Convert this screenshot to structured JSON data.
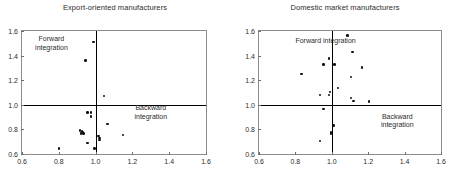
{
  "chart_data": [
    {
      "type": "scatter",
      "title": "Export-oriented manufacturers",
      "xlabel": "",
      "ylabel": "",
      "xlim": [
        0.6,
        1.6
      ],
      "ylim": [
        0.6,
        1.6
      ],
      "xticks": [
        "0.6",
        "0.8",
        "1.0",
        "1.2",
        "1.4",
        "1.6"
      ],
      "xtick_values": [
        0.6,
        0.8,
        1.0,
        1.2,
        1.4,
        1.6
      ],
      "yticks": [
        "0.6",
        "0.8",
        "1.0",
        "1.2",
        "1.4",
        "1.6"
      ],
      "ytick_values": [
        0.6,
        0.8,
        1.0,
        1.2,
        1.4,
        1.6
      ],
      "grid": false,
      "legend": "none",
      "reference_lines": {
        "x": 1.0,
        "y": 1.0
      },
      "annotations": [
        {
          "text": "Forward\nintegration",
          "x": 0.76,
          "y": 1.5,
          "align": "center"
        },
        {
          "text": "Backward integration",
          "x": 1.3,
          "y": 0.94,
          "align": "center"
        }
      ],
      "points": [
        {
          "x": 0.99,
          "y": 1.51
        },
        {
          "x": 0.945,
          "y": 1.36
        },
        {
          "x": 1.045,
          "y": 1.07
        },
        {
          "x": 0.955,
          "y": 0.935
        },
        {
          "x": 0.975,
          "y": 0.935
        },
        {
          "x": 0.975,
          "y": 0.905
        },
        {
          "x": 1.065,
          "y": 0.845
        },
        {
          "x": 0.915,
          "y": 0.79
        },
        {
          "x": 0.925,
          "y": 0.785
        },
        {
          "x": 0.93,
          "y": 0.775
        },
        {
          "x": 0.92,
          "y": 0.765
        },
        {
          "x": 0.935,
          "y": 0.765
        },
        {
          "x": 1.15,
          "y": 0.755
        },
        {
          "x": 1.015,
          "y": 0.745
        },
        {
          "x": 1.02,
          "y": 0.73
        },
        {
          "x": 1.02,
          "y": 0.715
        },
        {
          "x": 0.955,
          "y": 0.69
        },
        {
          "x": 0.8,
          "y": 0.645
        },
        {
          "x": 0.995,
          "y": 0.645
        }
      ]
    },
    {
      "type": "scatter",
      "title": "Domestic market manufacturers",
      "xlabel": "",
      "ylabel": "",
      "xlim": [
        0.6,
        1.6
      ],
      "ylim": [
        0.6,
        1.6
      ],
      "xticks": [
        "0.6",
        "0.8",
        "1.0",
        "1.2",
        "1.4",
        "1.6"
      ],
      "xtick_values": [
        0.6,
        0.8,
        1.0,
        1.2,
        1.4,
        1.6
      ],
      "yticks": [
        "0.6",
        "0.8",
        "1.0",
        "1.2",
        "1.4",
        "1.6"
      ],
      "ytick_values": [
        0.6,
        0.8,
        1.0,
        1.2,
        1.4,
        1.6
      ],
      "grid": false,
      "legend": "none",
      "reference_lines": {
        "x": 1.0,
        "y": 1.0
      },
      "annotations": [
        {
          "text": "Forward integration",
          "x": 0.8,
          "y": 1.52,
          "align": "left"
        },
        {
          "text": "Backward\nintegration",
          "x": 1.36,
          "y": 0.87,
          "align": "center"
        }
      ],
      "points": [
        {
          "x": 1.085,
          "y": 1.565
        },
        {
          "x": 1.115,
          "y": 1.43
        },
        {
          "x": 0.985,
          "y": 1.375
        },
        {
          "x": 0.955,
          "y": 1.33
        },
        {
          "x": 1.015,
          "y": 1.33
        },
        {
          "x": 1.165,
          "y": 1.305
        },
        {
          "x": 0.835,
          "y": 1.25
        },
        {
          "x": 1.105,
          "y": 1.225
        },
        {
          "x": 1.035,
          "y": 1.135
        },
        {
          "x": 0.99,
          "y": 1.105
        },
        {
          "x": 0.935,
          "y": 1.08
        },
        {
          "x": 0.985,
          "y": 1.08
        },
        {
          "x": 1.105,
          "y": 1.055
        },
        {
          "x": 1.12,
          "y": 1.03
        },
        {
          "x": 1.205,
          "y": 1.025
        },
        {
          "x": 0.955,
          "y": 0.965
        },
        {
          "x": 1.01,
          "y": 0.83
        },
        {
          "x": 0.995,
          "y": 0.775
        },
        {
          "x": 0.995,
          "y": 0.765
        },
        {
          "x": 0.935,
          "y": 0.705
        }
      ]
    }
  ]
}
